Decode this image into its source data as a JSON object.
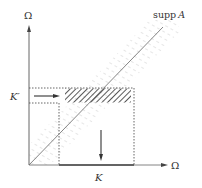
{
  "diagram": {
    "axes": {
      "vertical_label": "Ω",
      "horizontal_label": "Ω"
    },
    "labels": {
      "support": "supp",
      "support_operator": "A",
      "k_prime": "K′",
      "k": "K"
    },
    "colors": {
      "axis": "#555555",
      "diagonal": "#777777",
      "band_hatch": "#cfcfcf",
      "dark_hatch": "#333333",
      "dotted": "#555555",
      "text": "#333333"
    },
    "elements": [
      "vertical axis Ω",
      "horizontal axis Ω",
      "diagonal line (supp A)",
      "light hatched band around diagonal",
      "dark hatched rectangle (image of K′ restricted)",
      "dotted rectangle K × K′ region",
      "right arrow from K′",
      "down arrow to K"
    ]
  }
}
